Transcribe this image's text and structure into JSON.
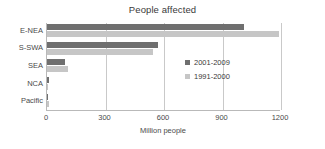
{
  "chart_data": {
    "type": "bar",
    "orientation": "horizontal",
    "title": "People affected",
    "xlabel": "Million people",
    "ylabel": "",
    "xlim": [
      0,
      1200
    ],
    "xticks": [
      0,
      300,
      600,
      900,
      1200
    ],
    "grid": true,
    "legend_position": "inside-lower-right",
    "categories": [
      "E-NEA",
      "S-SWA",
      "SEA",
      "NCA",
      "Pacific"
    ],
    "series": [
      {
        "name": "2001-2009",
        "color": "#6f6f6f",
        "values": [
          1010,
          570,
          90,
          8,
          3
        ]
      },
      {
        "name": "1991-2000",
        "color": "#c6c6c6",
        "values": [
          1190,
          545,
          110,
          5,
          12
        ]
      }
    ]
  }
}
